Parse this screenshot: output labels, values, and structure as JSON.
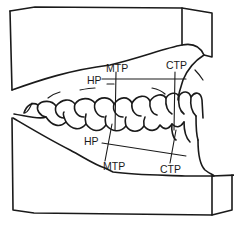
{
  "diagram": {
    "colors": {
      "line": "#1a1a1a",
      "background": "#ffffff"
    },
    "labels": {
      "upper": {
        "hp": "HP",
        "mtp": "MTP",
        "ctp": "CTP"
      },
      "lower": {
        "hp": "HP",
        "mtp": "MTP",
        "ctp": "CTP"
      }
    }
  }
}
